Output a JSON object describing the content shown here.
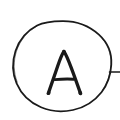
{
  "canvas": {
    "width": 120,
    "height": 120,
    "background_color": "#ffffff",
    "ink_color": "#1a1a1a",
    "style": "hand-drawn-scan"
  },
  "drawing": {
    "title": "Circled letter A with lead line",
    "description": "Hand-drawn circle enclosing the capital letter A, with a short horizontal lead line exiting the circle at the right side and running off the right edge of the image.",
    "elements": [
      {
        "name": "circle-outline",
        "kind": "circle",
        "center_x": 62,
        "center_y": 70,
        "radius": 49,
        "stroke_width": 1.7,
        "stroke_color": "#1a1a1a",
        "fill": "none"
      },
      {
        "name": "letter-a",
        "kind": "text-glyph",
        "character": "A",
        "center_x": 64,
        "baseline_y": 93,
        "apex_y": 51,
        "left_x": 47,
        "right_x": 81,
        "crossbar_y": 79,
        "stroke_width": 3.2,
        "stroke_color": "#1a1a1a"
      },
      {
        "name": "lead-line-right",
        "kind": "line",
        "x1": 110,
        "y1": 72,
        "x2": 120,
        "y2": 72,
        "stroke_width": 1.7,
        "stroke_color": "#1a1a1a",
        "clipped_at_edge": "right"
      }
    ]
  },
  "labels": {
    "glyph": "A"
  }
}
